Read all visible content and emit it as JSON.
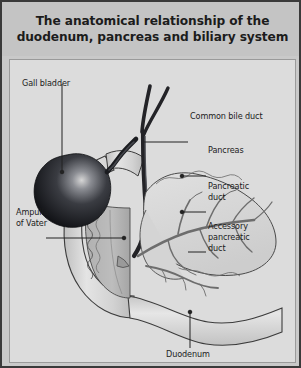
{
  "figure": {
    "title": "The anatomical relationship of the duodenum,\npancreas and biliary system",
    "border_color": "#3a3a3a",
    "title_band_color": "#c4c4c4",
    "panel_background": "#dcdcdc",
    "outer_background": "#c9c9c9",
    "text_color": "#1b1b1b"
  },
  "labels": {
    "gall_bladder": "Gall bladder",
    "common_bile_duct": "Common bile duct",
    "pancreas": "Pancreas",
    "pancreatic_duct": "Pancreatic\nduct",
    "accessory_pancreatic_duct": "Accessory\npancreatic\nduct",
    "ampulla_of_vater": "Ampulla\nof Vater",
    "duodenum": "Duodenum"
  },
  "structures": {
    "gallbladder_fill_dark": "#15161a",
    "gallbladder_fill_mid": "#3a3c42",
    "gallbladder_highlight": "#d8d8d8",
    "duodenum_fill": "#d2d2d2",
    "duodenum_outline": "#3c3c3c",
    "pancreas_fill": "#d7d7d7",
    "duct_color": "#6d6d6d",
    "bile_duct_color": "#232327",
    "cutaway_fill": "#b4b4b4",
    "leader_color": "#232323"
  }
}
